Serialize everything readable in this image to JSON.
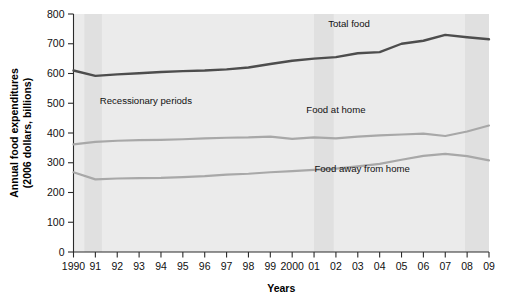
{
  "chart_data": {
    "type": "line",
    "title": "",
    "xlabel": "Years",
    "ylabel": "Annual food expenditures\n(2006 dollars, billions)",
    "ylabel_line1": "Annual food expenditures",
    "ylabel_line2": "(2006 dollars, billions)",
    "x": [
      1990,
      1991,
      1992,
      1993,
      1994,
      1995,
      1996,
      1997,
      1998,
      1999,
      2000,
      2001,
      2002,
      2003,
      2004,
      2005,
      2006,
      2007,
      2008,
      2009
    ],
    "categories": [
      "1990",
      "91",
      "92",
      "93",
      "94",
      "95",
      "96",
      "97",
      "98",
      "99",
      "2000",
      "01",
      "02",
      "03",
      "04",
      "05",
      "06",
      "07",
      "08",
      "09"
    ],
    "xtick_labels": [
      "1990",
      "91",
      "92",
      "93",
      "94",
      "95",
      "96",
      "97",
      "98",
      "99",
      "2000",
      "01",
      "02",
      "03",
      "04",
      "05",
      "06",
      "07",
      "08",
      "09"
    ],
    "ytick_labels": [
      "0",
      "100",
      "200",
      "300",
      "400",
      "500",
      "600",
      "700",
      "800"
    ],
    "ytick_values": [
      0,
      100,
      200,
      300,
      400,
      500,
      600,
      700,
      800
    ],
    "ylim": [
      0,
      800
    ],
    "xlim": [
      1990,
      2009
    ],
    "grid": false,
    "legend_position": "inline-annotations",
    "series": [
      {
        "name": "Total food",
        "color": "#4d4d4d",
        "label_x": 2002.6,
        "label_y": 757,
        "values": [
          610,
          592,
          597,
          601,
          605,
          608,
          610,
          614,
          620,
          632,
          643,
          650,
          655,
          668,
          672,
          700,
          710,
          730,
          722,
          715
        ]
      },
      {
        "name": "Food at home",
        "color": "#a8a8a8",
        "label_x": 2002.0,
        "label_y": 468,
        "values": [
          362,
          370,
          374,
          376,
          377,
          379,
          382,
          384,
          385,
          388,
          380,
          385,
          382,
          388,
          392,
          395,
          398,
          390,
          405,
          425
        ]
      },
      {
        "name": "Food away from home",
        "color": "#a8a8a8",
        "label_x": 2003.2,
        "label_y": 268,
        "values": [
          268,
          244,
          247,
          248,
          249,
          252,
          255,
          260,
          263,
          268,
          272,
          276,
          280,
          288,
          296,
          310,
          323,
          330,
          322,
          308
        ]
      }
    ],
    "annotations": [
      {
        "name": "recessionary-periods",
        "text": "Recessionary periods",
        "x": 1991.2,
        "y": 497
      }
    ],
    "recession_bands": [
      {
        "start": 1990.5,
        "end": 1991.3
      },
      {
        "start": 2001.0,
        "end": 2001.9
      },
      {
        "start": 2007.9,
        "end": 2009.0
      }
    ],
    "colors": {
      "total_food": "#4d4d4d",
      "food_at_home": "#a8a8a8",
      "food_away_from_home": "#a8a8a8",
      "plot_background": "#ebebeb",
      "recession_band": "#e0e0e0",
      "axis": "#2b2b2b"
    }
  }
}
